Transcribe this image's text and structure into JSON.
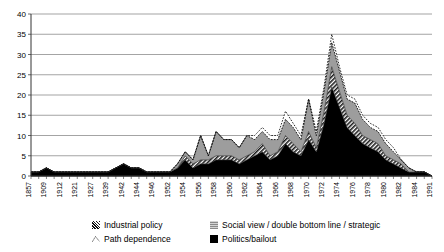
{
  "chart_data": {
    "type": "area",
    "stacked": true,
    "title": "",
    "subtitle": "",
    "xlabel": "",
    "ylabel": "",
    "ylim": [
      0,
      40
    ],
    "yticks": [
      0,
      5,
      10,
      15,
      20,
      25,
      30,
      35,
      40
    ],
    "grid": true,
    "legend_position": "bottom",
    "x_tick_labels": [
      "1857",
      "1909",
      "1912",
      "1921",
      "1927",
      "1939",
      "1942",
      "1944",
      "1946",
      "1952",
      "1954",
      "1956",
      "1958",
      "1960",
      "1962",
      "1964",
      "1966",
      "1968",
      "1970",
      "1972",
      "1974",
      "1976",
      "1978",
      "1980",
      "1982",
      "1984",
      "1991"
    ],
    "x": [
      "1857",
      "1909",
      "1910",
      "1911",
      "1912",
      "1918",
      "1921",
      "1924",
      "1927",
      "1933",
      "1939",
      "1940",
      "1942",
      "1943",
      "1944",
      "1945",
      "1946",
      "1950",
      "1952",
      "1953",
      "1954",
      "1955",
      "1956",
      "1957",
      "1958",
      "1959",
      "1960",
      "1961",
      "1962",
      "1963",
      "1964",
      "1965",
      "1966",
      "1967",
      "1968",
      "1969",
      "1970",
      "1971",
      "1972",
      "1973",
      "1974",
      "1975",
      "1976",
      "1977",
      "1978",
      "1979",
      "1980",
      "1981",
      "1982",
      "1983",
      "1984",
      "1986",
      "1991"
    ],
    "series": [
      {
        "name": "Politics/bailout",
        "color": "#000000",
        "pattern": "solid-black",
        "values": [
          1,
          1,
          2,
          1,
          1,
          1,
          1,
          1,
          1,
          1,
          1,
          2,
          3,
          2,
          2,
          1,
          1,
          1,
          1,
          2,
          4,
          2,
          3,
          3,
          4,
          4,
          4,
          3,
          4,
          5,
          6,
          4,
          5,
          8,
          6,
          5,
          9,
          6,
          13,
          22,
          17,
          12,
          10,
          8,
          7,
          6,
          4,
          3,
          2,
          1,
          1,
          1,
          0
        ]
      },
      {
        "name": "Industrial policy",
        "color": "#4a4a4a",
        "pattern": "diagonal-hatch",
        "values": [
          0,
          0,
          0,
          0,
          0,
          0,
          0,
          0,
          0,
          0,
          0,
          0,
          0,
          0,
          0,
          0,
          0,
          0,
          0,
          0,
          1,
          1,
          1,
          1,
          1,
          1,
          1,
          1,
          1,
          1,
          2,
          1,
          1,
          2,
          2,
          1,
          2,
          1,
          3,
          5,
          4,
          3,
          3,
          2,
          2,
          2,
          1,
          1,
          1,
          0,
          0,
          0,
          0
        ]
      },
      {
        "name": "Social view / double bottom line / strategic",
        "color": "#a8a8a8",
        "pattern": "light-gray",
        "values": [
          0,
          0,
          0,
          0,
          0,
          0,
          0,
          0,
          0,
          0,
          0,
          0,
          0,
          0,
          0,
          0,
          0,
          0,
          0,
          1,
          1,
          1,
          6,
          1,
          6,
          4,
          4,
          3,
          5,
          3,
          3,
          4,
          3,
          4,
          4,
          3,
          8,
          3,
          5,
          6,
          5,
          4,
          5,
          4,
          3,
          3,
          3,
          2,
          1,
          1,
          0,
          0,
          0
        ]
      },
      {
        "name": "Path dependence",
        "color": "#ffffff",
        "pattern": "white-dotted-outline",
        "values": [
          0,
          0,
          0,
          0,
          0,
          0,
          0,
          0,
          0,
          0,
          0,
          0,
          0,
          0,
          0,
          0,
          0,
          0,
          0,
          0,
          0,
          0,
          0,
          0,
          0,
          0,
          0,
          0,
          0,
          1,
          1,
          1,
          1,
          2,
          1,
          1,
          0,
          1,
          1,
          2,
          1,
          1,
          1,
          1,
          1,
          1,
          1,
          1,
          0,
          0,
          0,
          0,
          0
        ]
      }
    ],
    "totals": [
      1,
      1,
      2,
      1,
      1,
      1,
      1,
      1,
      1,
      1,
      1,
      2,
      3,
      2,
      2,
      1,
      1,
      1,
      1,
      3,
      6,
      4,
      10,
      5,
      11,
      9,
      9,
      7,
      10,
      10,
      12,
      10,
      10,
      16,
      13,
      10,
      19,
      11,
      22,
      35,
      27,
      20,
      19,
      15,
      13,
      12,
      9,
      7,
      4,
      2,
      1,
      1,
      0
    ]
  },
  "legend": {
    "items": [
      {
        "label": "Industrial policy",
        "icon": "hatch-swatch-icon"
      },
      {
        "label": "Social view / double bottom line / strategic",
        "icon": "gray-swatch-icon"
      },
      {
        "label": "Path dependence",
        "icon": "dotted-swatch-icon"
      },
      {
        "label": "Politics/bailout",
        "icon": "black-swatch-icon"
      }
    ]
  },
  "colors": {
    "politics": "#000000",
    "industrial": "#4a4a4a",
    "social": "#a8a8a8",
    "path": "#ffffff",
    "grid": "#7d7d7d",
    "axis": "#555555"
  }
}
